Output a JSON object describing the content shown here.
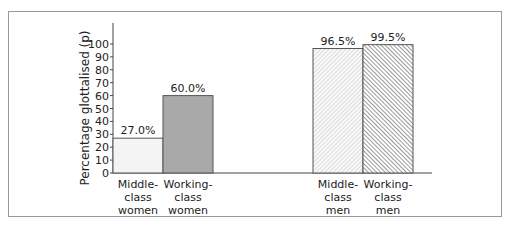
{
  "chart_data": {
    "type": "bar",
    "title": "",
    "xlabel": "",
    "ylabel": "Percentage glottalised (p)",
    "ylim": [
      0,
      100
    ],
    "yticks": [
      0,
      10,
      20,
      30,
      40,
      50,
      60,
      70,
      80,
      90,
      100
    ],
    "grid": false,
    "legend": "none",
    "categories": [
      "Middle-class women",
      "Working-class women",
      "Middle-class men",
      "Working-class men"
    ],
    "category_lines": [
      [
        "Middle-",
        "class",
        "women"
      ],
      [
        "Working-",
        "class",
        "women"
      ],
      [
        "Middle-",
        "class",
        "men"
      ],
      [
        "Working-",
        "class",
        "men"
      ]
    ],
    "values": [
      27.0,
      60.0,
      96.5,
      99.5
    ],
    "data_labels": [
      "27.0%",
      "60.0%",
      "96.5%",
      "99.5%"
    ],
    "fills": [
      "light-solid",
      "dark-solid",
      "light-hatch",
      "dark-hatch"
    ]
  },
  "colors": {
    "bar_light": "#f4f4f4",
    "bar_dark": "#a9a9a9",
    "hatch_light": "#bdbdbd",
    "hatch_dark": "#555555",
    "axis": "#444444",
    "frame": "#9a9a9a"
  }
}
